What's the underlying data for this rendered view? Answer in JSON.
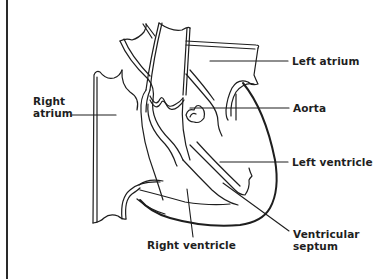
{
  "diagram": {
    "stroke_color": "#1e1e1e",
    "background_color": "#ffffff",
    "labels": {
      "left_atrium": "Left atrium",
      "aorta": "Aorta",
      "right_atrium_line1": "Right",
      "right_atrium_line2": "atrium",
      "left_ventricle": "Left ventricle",
      "right_ventricle": "Right ventricle",
      "ventricular_septum_line1": "Ventricular",
      "ventricular_septum_line2": "septum"
    }
  }
}
